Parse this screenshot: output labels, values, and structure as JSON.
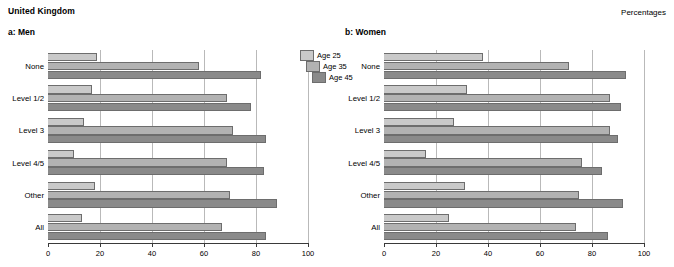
{
  "header": {
    "country": "United Kingdom",
    "units_label": "Percentages"
  },
  "legend": {
    "items": [
      {
        "label": "Age 25",
        "color": "#c9c9c9"
      },
      {
        "label": "Age 35",
        "color": "#b2b2b2"
      },
      {
        "label": "Age 45",
        "color": "#8a8a8a"
      }
    ]
  },
  "chart_data": [
    {
      "type": "bar",
      "title": "a: Men",
      "orientation": "horizontal",
      "xlabel": "",
      "ylabel": "",
      "xlim": [
        0,
        100
      ],
      "xticks": [
        0,
        20,
        40,
        60,
        80,
        100
      ],
      "grid": true,
      "legend_position": "top-right",
      "categories": [
        "None",
        "Level 1/2",
        "Level 3",
        "Level 4/5",
        "Other",
        "All"
      ],
      "series": [
        {
          "name": "Age 25",
          "values": [
            19,
            17,
            14,
            10,
            18,
            13
          ]
        },
        {
          "name": "Age 35",
          "values": [
            58,
            69,
            71,
            69,
            70,
            67
          ]
        },
        {
          "name": "Age 45",
          "values": [
            82,
            78,
            84,
            83,
            88,
            84
          ]
        }
      ]
    },
    {
      "type": "bar",
      "title": "b: Women",
      "orientation": "horizontal",
      "xlabel": "",
      "ylabel": "",
      "xlim": [
        0,
        100
      ],
      "xticks": [
        0,
        20,
        40,
        60,
        80,
        100
      ],
      "grid": true,
      "legend_position": "none",
      "categories": [
        "None",
        "Level 1/2",
        "Level 3",
        "Level 4/5",
        "Other",
        "All"
      ],
      "series": [
        {
          "name": "Age 25",
          "values": [
            38,
            71,
            93,
            0,
            0,
            0
          ]
        },
        {
          "name": "Age 35",
          "values": [
            0,
            0,
            0,
            0,
            0,
            0
          ]
        },
        {
          "name": "Age 45",
          "values": [
            0,
            0,
            0,
            0,
            0,
            0
          ]
        }
      ]
    }
  ],
  "panels": [
    {
      "id": "men",
      "title": "a: Men",
      "xticks": [
        "0",
        "20",
        "40",
        "60",
        "80",
        "100"
      ],
      "groups": [
        {
          "label": "None",
          "bars": [
            {
              "series": "Age 25",
              "value": 19
            },
            {
              "series": "Age 35",
              "value": 58
            },
            {
              "series": "Age 45",
              "value": 82
            }
          ]
        },
        {
          "label": "Level 1/2",
          "bars": [
            {
              "series": "Age 25",
              "value": 17
            },
            {
              "series": "Age 35",
              "value": 69
            },
            {
              "series": "Age 45",
              "value": 78
            }
          ]
        },
        {
          "label": "Level 3",
          "bars": [
            {
              "series": "Age 25",
              "value": 14
            },
            {
              "series": "Age 35",
              "value": 71
            },
            {
              "series": "Age 45",
              "value": 84
            }
          ]
        },
        {
          "label": "Level 4/5",
          "bars": [
            {
              "series": "Age 25",
              "value": 10
            },
            {
              "series": "Age 35",
              "value": 69
            },
            {
              "series": "Age 45",
              "value": 83
            }
          ]
        },
        {
          "label": "Other",
          "bars": [
            {
              "series": "Age 25",
              "value": 18
            },
            {
              "series": "Age 35",
              "value": 70
            },
            {
              "series": "Age 45",
              "value": 88
            }
          ]
        },
        {
          "label": "All",
          "bars": [
            {
              "series": "Age 25",
              "value": 13
            },
            {
              "series": "Age 35",
              "value": 67
            },
            {
              "series": "Age 45",
              "value": 84
            }
          ]
        }
      ]
    },
    {
      "id": "women",
      "title": "b: Women",
      "xticks": [
        "0",
        "20",
        "40",
        "60",
        "80",
        "100"
      ],
      "groups": [
        {
          "label": "None",
          "bars": [
            {
              "series": "Age 25",
              "value": 38
            },
            {
              "series": "Age 35",
              "value": 71
            },
            {
              "series": "Age 45",
              "value": 93
            }
          ]
        },
        {
          "label": "Level 1/2",
          "bars": [
            {
              "series": "Age 25",
              "value": 32
            },
            {
              "series": "Age 35",
              "value": 87
            },
            {
              "series": "Age 45",
              "value": 91
            }
          ]
        },
        {
          "label": "Level 3",
          "bars": [
            {
              "series": "Age 25",
              "value": 27
            },
            {
              "series": "Age 35",
              "value": 87
            },
            {
              "series": "Age 45",
              "value": 90
            }
          ]
        },
        {
          "label": "Level 4/5",
          "bars": [
            {
              "series": "Age 25",
              "value": 16
            },
            {
              "series": "Age 35",
              "value": 76
            },
            {
              "series": "Age 45",
              "value": 84
            }
          ]
        },
        {
          "label": "Other",
          "bars": [
            {
              "series": "Age 25",
              "value": 31
            },
            {
              "series": "Age 35",
              "value": 75
            },
            {
              "series": "Age 45",
              "value": 92
            }
          ]
        },
        {
          "label": "All",
          "bars": [
            {
              "series": "Age 25",
              "value": 25
            },
            {
              "series": "Age 35",
              "value": 74
            },
            {
              "series": "Age 45",
              "value": 86
            }
          ]
        }
      ]
    }
  ]
}
